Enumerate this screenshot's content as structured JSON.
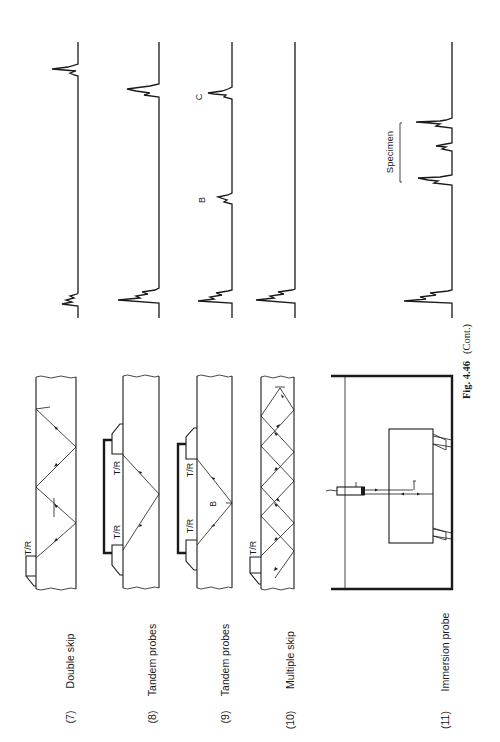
{
  "figure": {
    "caption_label": "Fig. 4.46",
    "caption_suffix": "(Cont.)",
    "orientation": "rotated 90° counter-clockwise",
    "panels": [
      {
        "number": "(7)",
        "title": "Double skip",
        "probe_labels": [
          "T/R"
        ],
        "trace_markers": []
      },
      {
        "number": "(8)",
        "title": "Tandem probes",
        "probe_labels": [
          "T/R",
          "T/R"
        ],
        "trace_markers": []
      },
      {
        "number": "(9)",
        "title": "Tandem probes",
        "probe_labels": [
          "T/R",
          "T/R"
        ],
        "diagram_markers": [
          "B"
        ],
        "trace_markers": [
          "B",
          "C"
        ]
      },
      {
        "number": "(10)",
        "title": "Multiple skip",
        "probe_labels": [
          "T/R"
        ],
        "trace_markers": []
      },
      {
        "number": "(11)",
        "title": "Immersion probe",
        "probe_labels": [],
        "trace_markers": [
          "Specimen"
        ]
      }
    ]
  },
  "labels": {
    "tr": "T/R",
    "b": "B",
    "c": "C",
    "specimen": "Specimen"
  }
}
